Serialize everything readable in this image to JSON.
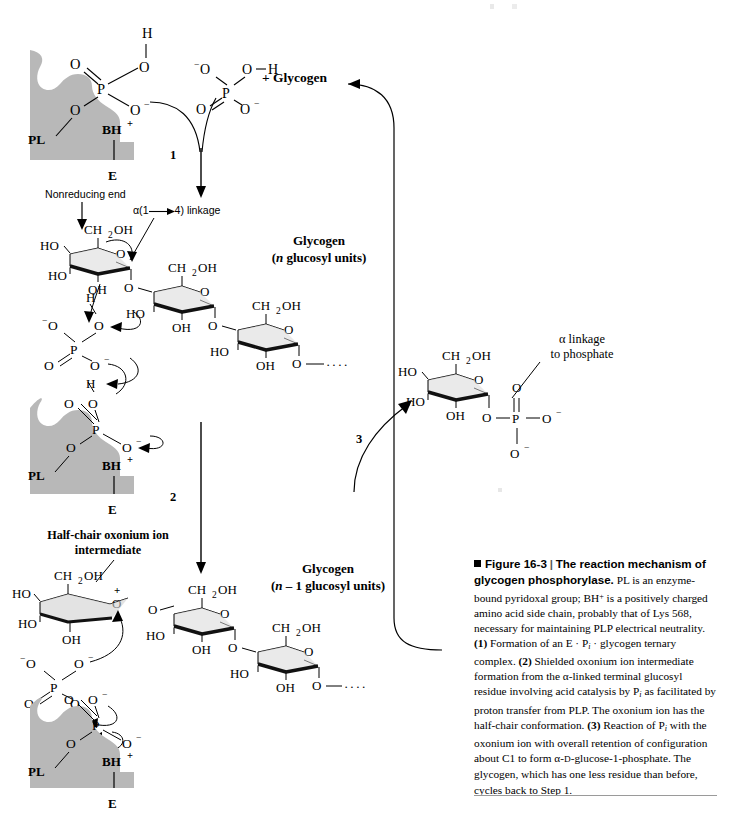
{
  "figure": {
    "number": "Figure 16-3",
    "separator": "|",
    "title": "The reaction mechanism of glycogen phosphorylase.",
    "caption_runs": [
      {
        "t": "PL is an enzyme-bound pyridoxal group; BH",
        "s": "n"
      },
      {
        "t": "+",
        "s": "sup"
      },
      {
        "t": " is a positively charged amino acid side chain, probably that of Lys 568, necessary for maintaining PLP electrical neutrality. ",
        "s": "n"
      },
      {
        "t": "(1)",
        "s": "b"
      },
      {
        "t": " Formation of an E · P",
        "s": "n"
      },
      {
        "t": "i",
        "s": "subi"
      },
      {
        "t": " · glycogen ternary complex. ",
        "s": "n"
      },
      {
        "t": "(2)",
        "s": "b"
      },
      {
        "t": " Shielded oxonium ion intermediate formation from the α-linked terminal glucosyl residue involving acid catalysis by P",
        "s": "n"
      },
      {
        "t": "i",
        "s": "subi"
      },
      {
        "t": " as facilitated by proton transfer from PLP. The oxonium ion has the half-chair conformation. ",
        "s": "n"
      },
      {
        "t": "(3)",
        "s": "b"
      },
      {
        "t": " Reaction of P",
        "s": "n"
      },
      {
        "t": "i",
        "s": "subi"
      },
      {
        "t": " with the oxonium ion with overall retention of configuration about C1 to form α-",
        "s": "n"
      },
      {
        "t": "D",
        "s": "sc"
      },
      {
        "t": "-glucose-1-phosphate. The glycogen, which has one less residue than before, cycles back to Step 1.",
        "s": "n"
      }
    ]
  },
  "steps": {
    "one": "1",
    "two": "2",
    "three": "3"
  },
  "labels": {
    "nonreducing_end": "Nonreducing end",
    "alpha_linkage": "α(1",
    "alpha_linkage_tail": "4) linkage",
    "glycogen": "Glycogen",
    "glycogen_n": "(n glucosyl units)",
    "glycogen_n_italic": "n",
    "glycogen_n_rest": " glucosyl units)",
    "glycogen_nm1_italic": "n",
    "glycogen_nm1_rest": " – 1 glucosyl units)",
    "plus_glycogen": "+ Glycogen",
    "half_chair_line1": "Half-chair oxonium ion",
    "half_chair_line2": "intermediate",
    "alpha_to_phosphate_line1": "α linkage",
    "alpha_to_phosphate_line2": "to phosphate"
  },
  "atoms": {
    "P": "P",
    "O": "O",
    "H": "H",
    "E": "E",
    "PL": "PL",
    "BH": "BH",
    "plus": "+",
    "minus": "–",
    "O_minus": "O",
    "CH2OH": "CH",
    "CH2OH_sub": "2",
    "CH2OH_tail": "OH",
    "HO": "HO",
    "OH": "OH",
    "ellipsis": "····"
  },
  "colors": {
    "enzyme_gray": "#b8b8b8",
    "ring_bold": "#111111",
    "ring_face": "#cfcfcf",
    "ink": "#000000",
    "rule": "#9a9a9a"
  }
}
